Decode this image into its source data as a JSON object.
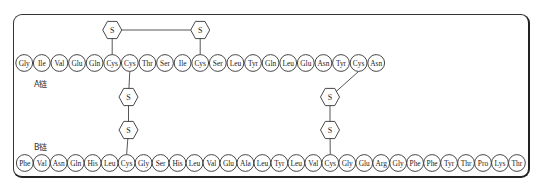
{
  "diagram": {
    "title": "",
    "chain_a": {
      "label": "A链",
      "residues": [
        "Gly",
        "Ile",
        "Val",
        "Glu",
        "Gln",
        "Cys",
        "Cys",
        "Thr",
        "Ser",
        "Ile",
        "Cys",
        "Ser",
        "Leu",
        "Tyr",
        "Gln",
        "Leu",
        "Glu",
        "Asn",
        "Tyr",
        "Cys",
        "Asn"
      ]
    },
    "chain_b": {
      "label": "B链",
      "residues": [
        "Phe",
        "Val",
        "Asn",
        "Gln",
        "His",
        "Leu",
        "Cys",
        "Gly",
        "Ser",
        "His",
        "Leu",
        "Val",
        "Glu",
        "Ala",
        "Leu",
        "Tyr",
        "Leu",
        "Val",
        "Cys",
        "Gly",
        "Glu",
        "Arg",
        "Gly",
        "Phe",
        "Phe",
        "Tyr",
        "Thr",
        "Pro",
        "Lys",
        "Thr"
      ]
    },
    "sulfur_label": "S",
    "disulfide_bonds": [
      {
        "name": "intra-a",
        "from": {
          "chain": "A",
          "index": 5
        },
        "to": {
          "chain": "A",
          "index": 10
        }
      },
      {
        "name": "inter-a6-b6",
        "from": {
          "chain": "A",
          "index": 6
        },
        "to": {
          "chain": "B",
          "index": 6
        }
      },
      {
        "name": "inter-a19-b18",
        "from": {
          "chain": "A",
          "index": 19
        },
        "to": {
          "chain": "B",
          "index": 18
        }
      }
    ]
  }
}
